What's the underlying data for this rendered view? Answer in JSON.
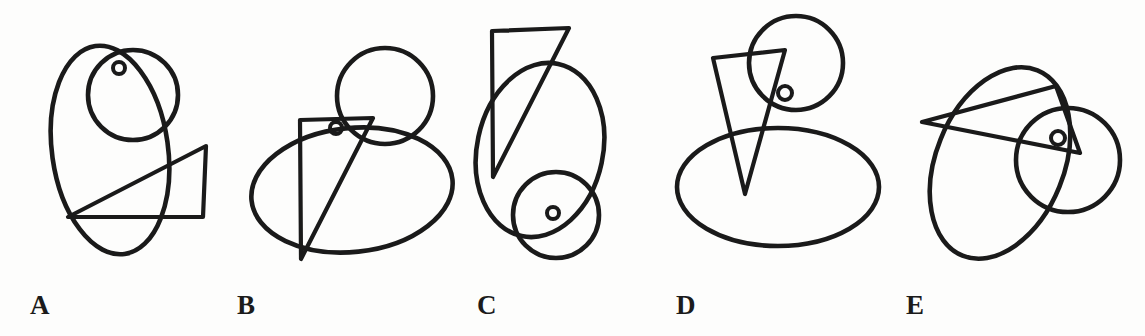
{
  "sheet": {
    "title": "Mental rotation style figure row",
    "width": 1145,
    "height": 336,
    "background_color": "#fdfdfc",
    "stroke_color": "#1a1a1a"
  },
  "panels": [
    {
      "id": "panel-a",
      "label": "A",
      "label_x": 30,
      "label_y": 292,
      "shapes": [
        {
          "kind": "ellipse",
          "name": "large-ellipse",
          "cx": 110,
          "cy": 150,
          "rx": 58,
          "ry": 105,
          "rotate": -8
        },
        {
          "kind": "circle",
          "name": "medium-circle",
          "cx": 133,
          "cy": 95,
          "r": 45
        },
        {
          "kind": "circle",
          "name": "small-dot-circle",
          "cx": 119,
          "cy": 68,
          "r": 6
        },
        {
          "kind": "triangle",
          "name": "right-triangle",
          "points": "206,146 68,217 203,217"
        }
      ]
    },
    {
      "id": "panel-b",
      "label": "B",
      "label_x": 237,
      "label_y": 292,
      "shapes": [
        {
          "kind": "ellipse",
          "name": "large-ellipse",
          "cx": 352,
          "cy": 190,
          "rx": 101,
          "ry": 62,
          "rotate": -6
        },
        {
          "kind": "circle",
          "name": "medium-circle",
          "cx": 385,
          "cy": 96,
          "r": 48
        },
        {
          "kind": "circle",
          "name": "small-dot-circle",
          "cx": 336,
          "cy": 128,
          "r": 6
        },
        {
          "kind": "triangle",
          "name": "narrow-triangle",
          "points": "300,120 373,118 301,259"
        }
      ]
    },
    {
      "id": "panel-c",
      "label": "C",
      "label_x": 477,
      "label_y": 292,
      "shapes": [
        {
          "kind": "ellipse",
          "name": "large-ellipse",
          "cx": 540,
          "cy": 150,
          "rx": 63,
          "ry": 88,
          "rotate": 12
        },
        {
          "kind": "circle",
          "name": "medium-circle",
          "cx": 556,
          "cy": 215,
          "r": 43
        },
        {
          "kind": "circle",
          "name": "small-dot-circle",
          "cx": 553,
          "cy": 213,
          "r": 6
        },
        {
          "kind": "triangle",
          "name": "narrow-triangle",
          "points": "492,31 569,28 493,177"
        }
      ]
    },
    {
      "id": "panel-d",
      "label": "D",
      "label_x": 676,
      "label_y": 292,
      "shapes": [
        {
          "kind": "ellipse",
          "name": "large-ellipse",
          "cx": 778,
          "cy": 187,
          "rx": 101,
          "ry": 59,
          "rotate": 0
        },
        {
          "kind": "circle",
          "name": "medium-circle",
          "cx": 796,
          "cy": 63,
          "r": 47
        },
        {
          "kind": "circle",
          "name": "small-dot-circle",
          "cx": 785,
          "cy": 93,
          "r": 7
        },
        {
          "kind": "triangle",
          "name": "narrow-triangle",
          "points": "713,58 785,50 745,194"
        }
      ]
    },
    {
      "id": "panel-e",
      "label": "E",
      "label_x": 906,
      "label_y": 292,
      "shapes": [
        {
          "kind": "ellipse",
          "name": "large-ellipse",
          "cx": 1000,
          "cy": 163,
          "rx": 64,
          "ry": 100,
          "rotate": 22
        },
        {
          "kind": "circle",
          "name": "medium-circle",
          "cx": 1068,
          "cy": 160,
          "r": 52
        },
        {
          "kind": "circle",
          "name": "small-dot-circle",
          "cx": 1058,
          "cy": 138,
          "r": 7
        },
        {
          "kind": "triangle",
          "name": "wide-triangle",
          "points": "922,122 1056,86 1080,153"
        }
      ]
    }
  ]
}
